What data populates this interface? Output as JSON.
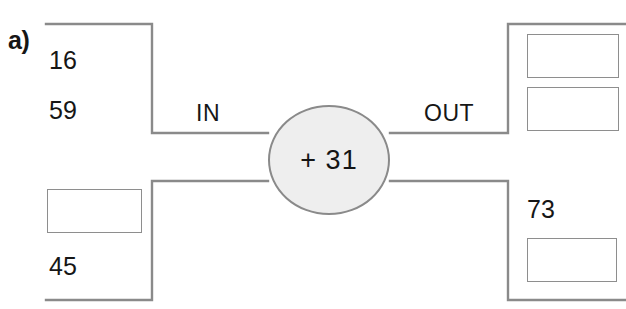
{
  "diagram": {
    "part_label": "a)",
    "operation": "+ 31",
    "in_label": "IN",
    "out_label": "OUT",
    "stroke_color": "#8a8a8a",
    "node_fill": "#eeeeee",
    "text_color": "#161616",
    "inputs": [
      {
        "id": "in-top-1",
        "value": "16",
        "type": "value"
      },
      {
        "id": "in-top-2",
        "value": "59",
        "type": "value"
      },
      {
        "id": "in-bottom-1",
        "value": "",
        "type": "blank"
      },
      {
        "id": "in-bottom-2",
        "value": "45",
        "type": "value"
      }
    ],
    "outputs": [
      {
        "id": "out-top-1",
        "value": "",
        "type": "blank"
      },
      {
        "id": "out-top-2",
        "value": "",
        "type": "blank"
      },
      {
        "id": "out-bottom-1",
        "value": "73",
        "type": "value"
      },
      {
        "id": "out-bottom-2",
        "value": "",
        "type": "blank"
      }
    ]
  }
}
